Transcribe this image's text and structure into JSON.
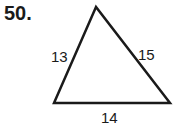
{
  "problem": {
    "number": "50."
  },
  "triangle": {
    "sides": {
      "left": "13",
      "right": "15",
      "bottom": "14"
    },
    "vertices": {
      "apex": [
        96,
        7
      ],
      "bottom_left": [
        54,
        103
      ],
      "bottom_right": [
        170,
        103
      ]
    },
    "stroke_color": "#1a1a1a"
  }
}
